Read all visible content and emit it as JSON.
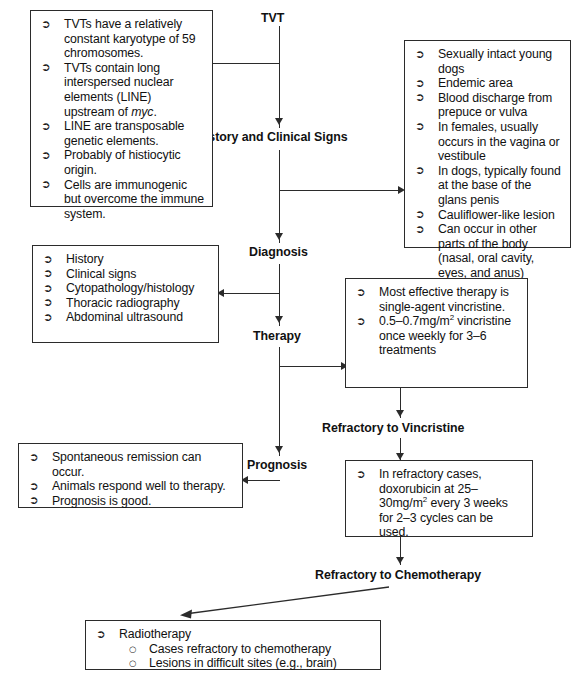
{
  "diagram": {
    "bullet_glyph": "➢",
    "sub_bullet_glyph": "○",
    "line_color": "#2b2b2b"
  },
  "spine": {
    "node1": "TVT",
    "node2": "History and Clinical Signs",
    "node3": "Diagnosis",
    "node4": "Therapy",
    "node5": "Refractory to Vincristine",
    "node6": "Prognosis",
    "node7": "Refractory to Chemotherapy"
  },
  "boxes": {
    "biology": {
      "items": [
        "TVTs have a relatively constant karyotype of 59 chromosomes.",
        "TVTs contain long interspersed nuclear elements (LINE) upstream of myc.",
        "LINE are transposable genetic elements.",
        "Probably of histiocytic origin.",
        "Cells are immunogenic but overcome the immune system."
      ]
    },
    "clinical_signs": {
      "items": [
        "Sexually intact young dogs",
        "Endemic area",
        "Blood discharge from prepuce or vulva",
        "In females, usually occurs in the vagina or vestibule",
        "In dogs, typically found at the base of the glans penis",
        "Cauliflower-like lesion",
        "Can occur in other parts of the body (nasal, oral cavity, eyes, and anus)"
      ]
    },
    "diagnosis": {
      "items": [
        "History",
        "Clinical signs",
        "Cytopathology/histology",
        "Thoracic radiography",
        "Abdominal ultrasound"
      ]
    },
    "therapy": {
      "items": [
        "Most effective therapy is single-agent vincristine.",
        "0.5–0.7mg/m2 vincristine once weekly for 3–6 treatments"
      ],
      "item1": "Most effective therapy is single-agent vincristine.",
      "item2_a": "0.5–0.7mg/m",
      "item2_sup": "2",
      "item2_b": " vincristine once weekly for 3–6 treatments"
    },
    "prognosis": {
      "items": [
        "Spontaneous remission can occur.",
        "Animals respond well to therapy.",
        "Prognosis is good."
      ]
    },
    "doxorubicin": {
      "item_a": "In refractory cases, doxorubicin at 25–30mg/m",
      "item_sup": "2",
      "item_b": " every 3 weeks for 2–3 cycles can be used."
    },
    "radiotherapy": {
      "main": "Radiotherapy",
      "sub": [
        "Cases refractory to chemotherapy",
        "Lesions in difficult sites (e.g., brain)"
      ]
    }
  }
}
